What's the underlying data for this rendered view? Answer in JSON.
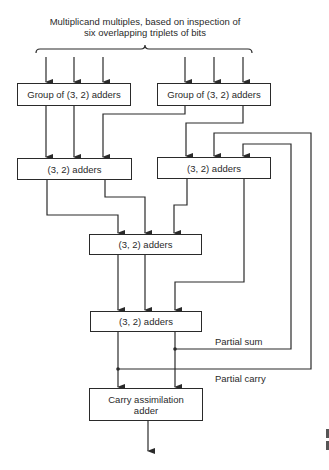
{
  "title": {
    "line1": "Multiplicand multiples, based on inspection of",
    "line2": "six overlapping triplets of bits"
  },
  "boxes": {
    "group_left": "Group of (3, 2) adders",
    "group_right": "Group of (3, 2) adders",
    "level2_left": "(3, 2) adders",
    "level2_right": "(3, 2) adders",
    "level3": "(3, 2) adders",
    "level4": "(3, 2) adders",
    "final_line1": "Carry assimilation",
    "final_line2": "adder"
  },
  "labels": {
    "partial_sum": "Partial sum",
    "partial_carry": "Partial carry"
  },
  "colors": {
    "line": "#2a2a2a",
    "background": "#ffffff"
  }
}
